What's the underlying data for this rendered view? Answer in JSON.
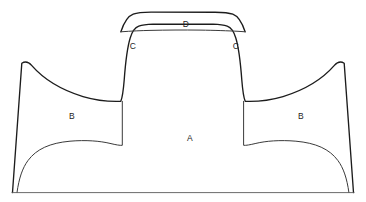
{
  "figure": {
    "type": "line-diagram",
    "canvas": {
      "width": 366,
      "height": 202
    },
    "background_color": "#ffffff",
    "stroke_color": "#1c1c1c",
    "inner_stroke_color": "#3a3a3a",
    "baseline_color": "#5a5a5a"
  },
  "labels": [
    {
      "id": "label-d",
      "text": "D",
      "x": 186,
      "y": 24
    },
    {
      "id": "label-c-left",
      "text": "C",
      "x": 133,
      "y": 46
    },
    {
      "id": "label-c-right",
      "text": "C",
      "x": 236,
      "y": 46
    },
    {
      "id": "label-b-left",
      "text": "B",
      "x": 72,
      "y": 116
    },
    {
      "id": "label-b-right",
      "text": "B",
      "x": 301,
      "y": 116
    },
    {
      "id": "label-a",
      "text": "A",
      "x": 190,
      "y": 138
    }
  ],
  "paths": {
    "outer_silhouette": "M 12.5 192.5 L 21.8 63.2 C 25.6 60.8 28.4 61.6 31.6 65.4 C 44.0 79.6 62.0 90.2 83.0 96.6 C 96.0 100.4 108.0 101.6 118.4 101.4 L 120.8 101.3 C 122.6 97.0 123.4 90.0 124.2 80.0 C 125.6 61.0 127.4 47.0 130.2 38.0 C 132.2 31.4 135.0 27.6 138.8 26.2 C 142.0 25.0 147.0 24.4 153.0 24.2 L 213.0 24.2 C 219.0 24.4 224.0 25.0 227.2 26.2 C 231.0 27.6 233.8 31.4 235.8 38.0 C 238.6 47.0 240.4 61.0 241.8 80.0 C 242.6 90.0 243.4 97.0 245.2 101.3 L 247.6 101.4 C 258.0 101.6 270.0 100.4 283.0 96.6 C 304.0 90.2 322.0 79.6 334.4 65.4 C 337.6 61.6 340.4 60.8 344.2 63.2 L 353.5 192.5",
    "inner_dome": "M 17.0 192.5 C 19.0 178.0 22.5 168.0 28.0 160.5 C 36.5 149.0 50.0 143.0 70.0 141.2 C 86.0 139.8 100.0 141.0 110.0 143.4 C 116.0 144.8 120.0 145.6 122.3 145.3 L 122.3 101.3",
    "inner_dome_right": "M 348.9 192.5 C 346.9 178.0 343.4 168.0 337.9 160.5 C 329.4 149.0 315.9 143.0 295.9 141.2 C 279.9 139.8 265.9 141.0 255.9 143.4 C 249.9 144.8 245.9 145.6 243.6 145.3 L 243.6 101.3",
    "top_cap": "M 120.9 31.8 C 124.2 21.6 127.8 16.2 133.2 14.2 C 137.0 12.8 143.0 12.3 151.0 12.2 L 215.0 12.2 C 223.0 12.3 229.0 12.8 232.8 14.2 C 238.2 16.2 241.8 21.6 245.1 31.8",
    "cap_sag": "M 120.9 31.8 C 132.0 31.0 141.0 30.6 150.0 30.4 C 166.0 30.0 184.0 29.9 200.0 30.1 C 215.0 30.3 228.0 30.8 238.0 31.3 L 245.1 31.8",
    "left_wall": "M 122.3 145.3 L 122.3 101.3 C 122.3 90.0 123.0 78.0 124.6 64.0 C 126.2 50.0 128.0 40.0 130.2 34.0 L 132.0 29.2",
    "baseline": "M 11.6 192.6 L 354.4 192.6"
  }
}
